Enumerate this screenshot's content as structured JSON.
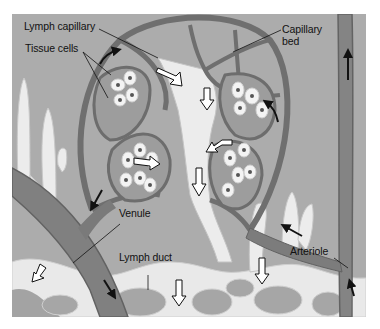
{
  "figure": {
    "colors": {
      "background": "#a9a9a9",
      "interstitial": "#b2b2b2",
      "vessel": "#7e7e7e",
      "vessel_edge": "#5f5f5f",
      "lymph": "#e8e8e8",
      "tissue": "#9a9a9a",
      "cell": "#f2f2f2",
      "nucleus": "#555555",
      "label": "#111111"
    },
    "labels": {
      "lymph_capillary": "Lymph capillary",
      "tissue_cells": "Tissue cells",
      "capillary_bed_line1": "Capillary",
      "capillary_bed_line2": "bed",
      "venule": "Venule",
      "lymph_duct": "Lymph duct",
      "arteriole": "Arteriole"
    }
  }
}
